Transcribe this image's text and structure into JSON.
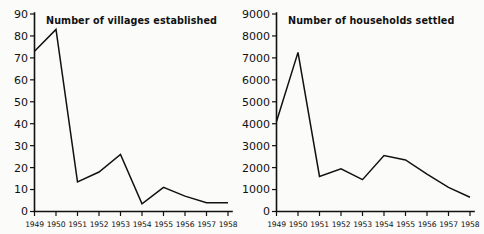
{
  "figure": {
    "background_color": "#fbfbfa",
    "line_color": "#111111",
    "panels": [
      "villages",
      "households"
    ]
  },
  "chart_data": [
    {
      "type": "line",
      "title": "Number of villages established",
      "xlabel": "",
      "ylabel": "",
      "categories": [
        "1949",
        "1950",
        "1951",
        "1952",
        "1953",
        "1954",
        "1955",
        "1956",
        "1957",
        "1958"
      ],
      "values": [
        73,
        83,
        13.5,
        18,
        26,
        3.5,
        11,
        7,
        4,
        4
      ],
      "ylim": [
        0,
        90
      ],
      "ytick_labels": [
        "0",
        "10",
        "20",
        "30",
        "40",
        "50",
        "60",
        "70",
        "80",
        "90"
      ],
      "ytick_values": [
        0,
        10,
        20,
        30,
        40,
        50,
        60,
        70,
        80,
        90
      ],
      "xtick_labels": [
        "1949",
        "1950",
        "1951",
        "1952",
        "1953",
        "1954",
        "1955",
        "1956",
        "1957",
        "1958"
      ],
      "grid": false,
      "legend": "none",
      "series_name": "villages established"
    },
    {
      "type": "line",
      "title": "Number of households settled",
      "xlabel": "",
      "ylabel": "",
      "categories": [
        "1949",
        "1950",
        "1951",
        "1952",
        "1953",
        "1954",
        "1955",
        "1956",
        "1957",
        "1958"
      ],
      "values": [
        4100,
        7250,
        1600,
        1950,
        1450,
        2550,
        2350,
        1700,
        1100,
        650
      ],
      "ylim": [
        0,
        9000
      ],
      "ytick_labels": [
        "0",
        "1000",
        "2000",
        "3000",
        "4000",
        "5000",
        "6000",
        "7000",
        "8000",
        "9000"
      ],
      "ytick_values": [
        0,
        1000,
        2000,
        3000,
        4000,
        5000,
        6000,
        7000,
        8000,
        9000
      ],
      "xtick_labels": [
        "1949",
        "1950",
        "1951",
        "1952",
        "1953",
        "1954",
        "1955",
        "1956",
        "1957",
        "1958"
      ],
      "grid": false,
      "legend": "none",
      "series_name": "households settled"
    }
  ]
}
